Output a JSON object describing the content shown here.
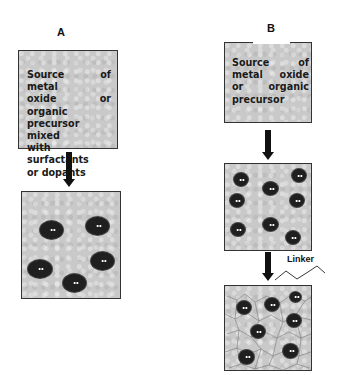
{
  "figure": {
    "panel_a": {
      "label": "A",
      "step1_text_lines": [
        "Source of  metal",
        "oxide or organic",
        "precursor mixed",
        "with surfactants",
        "or dopants"
      ],
      "step2_particles": 5
    },
    "panel_b": {
      "label": "B",
      "step1_text_lines": [
        "Source of",
        "metal oxide",
        "or organic",
        "precursor"
      ],
      "step2_particles": 8,
      "linker_label": "Linker",
      "step3_particles": 7
    },
    "colors": {
      "box_fill": "#c9c9c9",
      "border": "#333333",
      "particle": "#1f1f1f",
      "arrow": "#111111"
    }
  }
}
